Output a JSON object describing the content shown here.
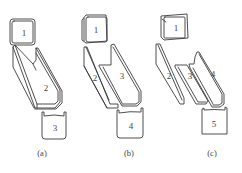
{
  "diagram": {
    "panels": [
      {
        "caption": "(a)",
        "parts": [
          "1",
          "2",
          "3"
        ]
      },
      {
        "caption": "(b)",
        "parts": [
          "1",
          "2",
          "3",
          "4"
        ]
      },
      {
        "caption": "(c)",
        "parts": [
          "1",
          "2",
          "3",
          "4",
          "5"
        ]
      }
    ]
  }
}
